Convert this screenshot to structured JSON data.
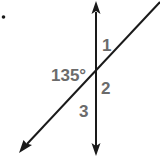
{
  "diagram": {
    "type": "intersecting-lines",
    "bullet": "•",
    "colors": {
      "line": "#1a1a1a",
      "label": "#6b6b6b",
      "background": "#ffffff"
    },
    "lines": [
      {
        "name": "vertical-line",
        "from": [
          96,
          156
        ],
        "to": [
          96,
          2
        ],
        "arrows": "both"
      },
      {
        "name": "diagonal-line",
        "from": [
          20,
          152
        ],
        "to": [
          160,
          2
        ],
        "arrows": "start"
      }
    ],
    "intersection": [
      96,
      75
    ],
    "labels": {
      "angle1": "1",
      "given_angle": "135°",
      "angle2": "2",
      "angle3": "3"
    }
  }
}
